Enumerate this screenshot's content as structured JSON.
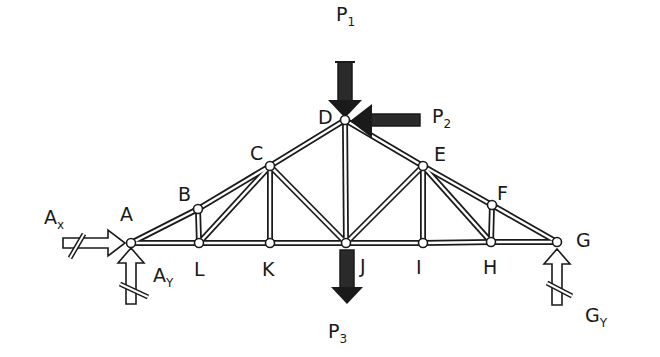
{
  "diagram": {
    "type": "truss",
    "colors": {
      "ink": "#1a1a1a",
      "fill": "#2a2a2a",
      "member_inner": "#ffffff"
    },
    "nodes": [
      {
        "id": "A",
        "label": "A",
        "x": 131,
        "y": 243,
        "label_x": 120,
        "label_y": 205
      },
      {
        "id": "B",
        "label": "B",
        "x": 198,
        "y": 209,
        "label_x": 178,
        "label_y": 185
      },
      {
        "id": "C",
        "label": "C",
        "x": 270,
        "y": 166,
        "label_x": 250,
        "label_y": 144
      },
      {
        "id": "D",
        "label": "D",
        "x": 345,
        "y": 120,
        "label_x": 318,
        "label_y": 108
      },
      {
        "id": "E",
        "label": "E",
        "x": 423,
        "y": 166,
        "label_x": 434,
        "label_y": 145
      },
      {
        "id": "F",
        "label": "F",
        "x": 492,
        "y": 205,
        "label_x": 497,
        "label_y": 184
      },
      {
        "id": "G",
        "label": "G",
        "x": 557,
        "y": 242,
        "label_x": 576,
        "label_y": 231
      },
      {
        "id": "H",
        "label": "H",
        "x": 491,
        "y": 242,
        "label_x": 483,
        "label_y": 258
      },
      {
        "id": "I",
        "label": "I",
        "x": 423,
        "y": 243,
        "label_x": 416,
        "label_y": 258
      },
      {
        "id": "J",
        "label": "J",
        "x": 346,
        "y": 243,
        "label_x": 360,
        "label_y": 257
      },
      {
        "id": "K",
        "label": "K",
        "x": 270,
        "y": 243,
        "label_x": 262,
        "label_y": 260
      },
      {
        "id": "L",
        "label": "L",
        "x": 199,
        "y": 243,
        "label_x": 194,
        "label_y": 260
      }
    ],
    "members": [
      [
        "A",
        "B"
      ],
      [
        "B",
        "C"
      ],
      [
        "C",
        "D"
      ],
      [
        "D",
        "E"
      ],
      [
        "E",
        "F"
      ],
      [
        "F",
        "G"
      ],
      [
        "A",
        "L"
      ],
      [
        "L",
        "K"
      ],
      [
        "K",
        "J"
      ],
      [
        "J",
        "I"
      ],
      [
        "I",
        "H"
      ],
      [
        "H",
        "G"
      ],
      [
        "B",
        "L"
      ],
      [
        "L",
        "C"
      ],
      [
        "C",
        "K"
      ],
      [
        "C",
        "J"
      ],
      [
        "D",
        "J"
      ],
      [
        "J",
        "E"
      ],
      [
        "E",
        "I"
      ],
      [
        "E",
        "H"
      ],
      [
        "F",
        "H"
      ]
    ],
    "loads": [
      {
        "id": "P1",
        "name": "P",
        "sub": "1",
        "direction": "down",
        "at": "D",
        "label_x": 336,
        "label_y": 5
      },
      {
        "id": "P2",
        "name": "P",
        "sub": "2",
        "direction": "left",
        "at": "D",
        "label_x": 432,
        "label_y": 107
      },
      {
        "id": "P3",
        "name": "P",
        "sub": "3",
        "direction": "down",
        "at": "J",
        "label_x": 328,
        "label_y": 322
      }
    ],
    "reactions": [
      {
        "id": "Ax",
        "name": "A",
        "sub": "x",
        "direction": "right",
        "at": "A",
        "label_x": 44,
        "label_y": 208
      },
      {
        "id": "Ay",
        "name": "A",
        "sub": "Y",
        "direction": "up",
        "at": "A",
        "label_x": 153,
        "label_y": 266
      },
      {
        "id": "Gy",
        "name": "G",
        "sub": "Y",
        "direction": "up",
        "at": "G",
        "label_x": 585,
        "label_y": 306
      }
    ]
  }
}
